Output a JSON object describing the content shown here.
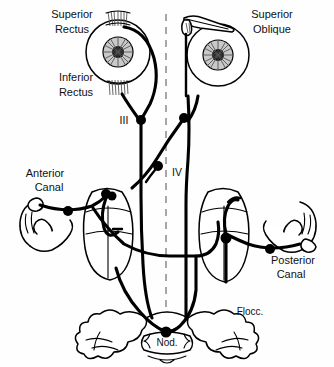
{
  "figure": {
    "background_color": "#ffffff",
    "line_color": "#000000",
    "midline_color": "#8a8a8a",
    "width": 334,
    "height": 367
  },
  "labels": {
    "superior_rectus": "Superior\nRectus",
    "superior_rectus_line1": "Superior",
    "superior_rectus_line2": "Rectus",
    "inferior_rectus_line1": "Inferior",
    "inferior_rectus_line2": "Rectus",
    "superior_oblique_line1": "Superior",
    "superior_oblique_line2": "Oblique",
    "anterior_canal_line1": "Anterior",
    "anterior_canal_line2": "Canal",
    "posterior_canal_line1": "Posterior",
    "posterior_canal_line2": "Canal",
    "nerve_three": "III",
    "nerve_four": "IV",
    "flocculus": "Flocc.",
    "nodulus": "Nod."
  },
  "structures": {
    "left_eye": "left-eyeball",
    "right_eye": "right-eyeball",
    "left_vestibular_nucleus": "left-vestibular-nucleus",
    "right_vestibular_nucleus": "right-vestibular-nucleus",
    "left_canal_loop": "left-anterior-semicircular-canal",
    "right_canal_loop": "right-posterior-semicircular-canal",
    "cerebellum": "cerebellum-flocculonodular-lobe",
    "midline": "brainstem-midline"
  }
}
